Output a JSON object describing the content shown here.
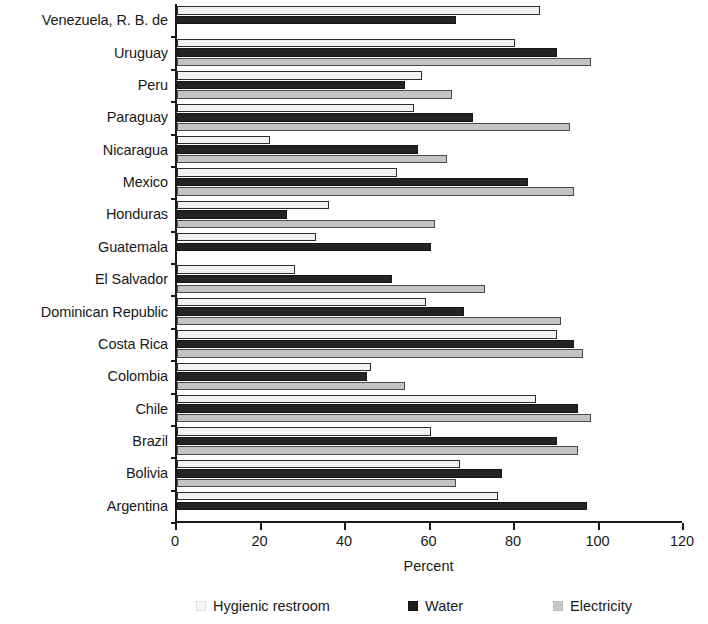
{
  "chart_data": {
    "type": "bar",
    "orientation": "horizontal",
    "title": "",
    "xlabel": "Percent",
    "ylabel": "",
    "xlim": [
      0,
      120
    ],
    "xticks": [
      0,
      20,
      40,
      60,
      80,
      100,
      120
    ],
    "grid": false,
    "legend_position": "bottom",
    "categories": [
      "Venezuela, R. B. de",
      "Uruguay",
      "Peru",
      "Paraguay",
      "Nicaragua",
      "Mexico",
      "Honduras",
      "Guatemala",
      "El Salvador",
      "Dominican Republic",
      "Costa Rica",
      "Colombia",
      "Chile",
      "Brazil",
      "Bolivia",
      "Argentina"
    ],
    "series": [
      {
        "name": "Hygienic restroom",
        "color": "#f2f2f2",
        "values": [
          86,
          80,
          58,
          56,
          22,
          52,
          36,
          33,
          28,
          59,
          90,
          46,
          85,
          60,
          67,
          76
        ]
      },
      {
        "name": "Water",
        "color": "#232323",
        "values": [
          66,
          90,
          54,
          70,
          57,
          83,
          26,
          60,
          51,
          68,
          94,
          45,
          95,
          90,
          77,
          97
        ]
      },
      {
        "name": "Electricity",
        "color": "#c4c4c4",
        "values": [
          0,
          98,
          65,
          93,
          64,
          94,
          61,
          0,
          73,
          91,
          96,
          54,
          98,
          95,
          66,
          0
        ]
      }
    ]
  },
  "axis": {
    "x_title": "Percent",
    "x_tick_labels": [
      "0",
      "20",
      "40",
      "60",
      "80",
      "100",
      "120"
    ]
  },
  "legend": {
    "items": [
      {
        "label": "Hygienic restroom",
        "swatch": "restroom-swatch"
      },
      {
        "label": "Water",
        "swatch": "water-swatch"
      },
      {
        "label": "Electricity",
        "swatch": "electricity-swatch"
      }
    ]
  }
}
